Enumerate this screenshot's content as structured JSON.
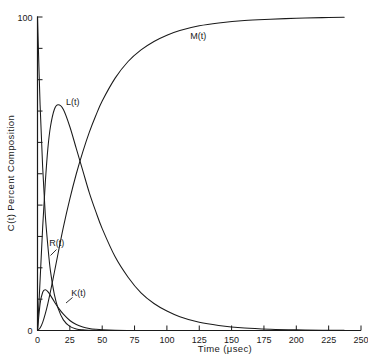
{
  "chart_data": {
    "type": "line",
    "title": "",
    "xlabel": "Time (μsec)",
    "ylabel": "C(t) Percent Composition",
    "xlim": [
      0,
      250
    ],
    "ylim": [
      0,
      100
    ],
    "grid": false,
    "legend_position": "inline-labels",
    "xticks": [
      0,
      25,
      50,
      75,
      100,
      125,
      150,
      175,
      200,
      225,
      250
    ],
    "xticklabels": [
      "0",
      "25",
      "50",
      "75",
      "100",
      "125",
      "150",
      "175",
      "200",
      "225",
      "250"
    ],
    "yticks": [
      0,
      10,
      20,
      30,
      40,
      50,
      60,
      70,
      80,
      90,
      100
    ],
    "yticklabels": [
      "0",
      "",
      "",
      "",
      "",
      "",
      "",
      "",
      "",
      "",
      "100"
    ],
    "x": [
      0,
      2,
      4,
      6,
      8,
      10,
      13,
      16,
      20,
      25,
      30,
      35,
      40,
      45,
      50,
      60,
      70,
      80,
      90,
      100,
      110,
      125,
      140,
      160,
      180,
      200,
      220,
      237
    ],
    "series": [
      {
        "name": "R(t)",
        "label": "R(t)",
        "values": [
          100,
          72,
          52,
          37,
          27,
          19,
          11.5,
          7.0,
          3.4,
          1.3,
          0.5,
          0.2,
          0.08,
          0.03,
          0.01,
          0,
          0,
          0,
          0,
          0,
          0,
          0,
          0,
          0,
          0,
          0,
          0,
          0
        ],
        "label_x": 9,
        "label_y": 27
      },
      {
        "name": "K(t)",
        "label": "K(t)",
        "values": [
          0,
          8.5,
          12.2,
          13.0,
          12.4,
          11.2,
          9.2,
          7.3,
          5.2,
          3.2,
          1.9,
          1.1,
          0.65,
          0.38,
          0.22,
          0.07,
          0.02,
          0.01,
          0,
          0,
          0,
          0,
          0,
          0,
          0,
          0,
          0,
          0
        ],
        "label_x": 26,
        "label_y": 11
      },
      {
        "name": "L(t)",
        "label": "L(t)",
        "values": [
          0,
          16,
          33,
          47,
          58,
          65,
          70.5,
          72,
          70.5,
          65,
          58,
          51,
          44,
          38,
          32.5,
          23.5,
          17,
          12,
          8.6,
          6.2,
          4.4,
          2.6,
          1.6,
          0.8,
          0.4,
          0.2,
          0.1,
          0.06
        ],
        "label_x": 22,
        "label_y": 72
      },
      {
        "name": "M(t)",
        "label": "M(t)",
        "values": [
          0,
          0.8,
          2.6,
          5.3,
          8.6,
          12.4,
          18.5,
          24.8,
          33.0,
          42.0,
          50.0,
          57.0,
          63.2,
          68.5,
          73.2,
          80.5,
          85.8,
          89.5,
          92.2,
          94.2,
          95.7,
          97.2,
          98.1,
          98.9,
          99.3,
          99.6,
          99.8,
          99.9
        ],
        "label_x": 118,
        "label_y": 93
      }
    ],
    "annotations": [
      {
        "text": "M(t)",
        "x": 118,
        "y": 93
      },
      {
        "text": "L(t)",
        "x": 22,
        "y": 72
      },
      {
        "text": "R(t)",
        "x": 9,
        "y": 27
      },
      {
        "text": "K(t)",
        "x": 26,
        "y": 11
      }
    ],
    "colors": {
      "curve": "#1a1a1a",
      "axis": "#1a1a1a",
      "background": "#ffffff"
    }
  }
}
